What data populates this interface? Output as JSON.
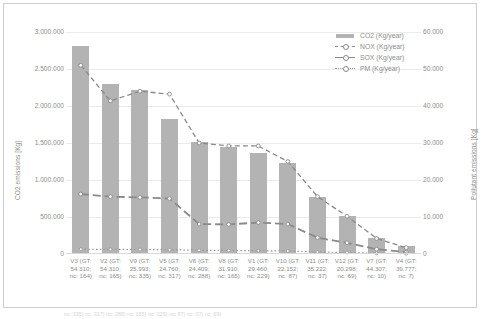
{
  "chart_data": {
    "type": "bar",
    "title": "",
    "xlabel": "",
    "ylabel": "CO2 emissions [Kg]",
    "y2label": "Pollutant emissions [Kg]",
    "grid": true,
    "legend_position": "top-right",
    "ylim": [
      0,
      3000000
    ],
    "y2lim": [
      0,
      60000
    ],
    "yticks": [
      "0",
      "500.000",
      "1.000.000",
      "1.500.000",
      "2.000.000",
      "2.500.000",
      "3.000.000"
    ],
    "ytick_values": [
      0,
      500000,
      1000000,
      1500000,
      2000000,
      2500000,
      3000000
    ],
    "y2ticks": [
      "0",
      "10.000",
      "20.000",
      "30.000",
      "40.000",
      "50.000",
      "60.000"
    ],
    "y2tick_values": [
      0,
      10000,
      20000,
      30000,
      40000,
      50000,
      60000
    ],
    "categories": [
      "V3 (GT: 54.310; nc: 164)",
      "V2 (GT: 54.310; nc: 165)",
      "V9 (GT: 25.993; nc: 335)",
      "V5 (GT: 24.760; nc: 317)",
      "V6 (GT: 24.409; nc: 288)",
      "V8 (GT: 31.910; nc: 165)",
      "V1 (GT: 29.460; nc: 229)",
      "V10 (GT: 22.152; nc: 87)",
      "V11 (GT: 35.222; nc: 37)",
      "V12 (GT: 20.298; nc: 69)",
      "V7 (GT: 44.307; nc: 10)",
      "V4 (GT: 39.777; nc: 7)"
    ],
    "category_parts": [
      [
        "V3 (GT:",
        "54.310;",
        "nc: 164)"
      ],
      [
        "V2 (GT:",
        "54.310;",
        "nc: 165)"
      ],
      [
        "V9 (GT:",
        "25.993;",
        "nc: 335)"
      ],
      [
        "V5 (GT:",
        "24.760;",
        "nc: 317)"
      ],
      [
        "V6 (GT:",
        "24.409;",
        "nc: 288)"
      ],
      [
        "V8 (GT:",
        "31.910;",
        "nc: 165)"
      ],
      [
        "V1 (GT:",
        "29.460;",
        "nc: 229)"
      ],
      [
        "V10 (GT:",
        "22.152;",
        "nc: 87)"
      ],
      [
        "V11 (GT:",
        "35.222;",
        "nc: 37)"
      ],
      [
        "V12 (GT:",
        "20.298;",
        "nc: 69)"
      ],
      [
        "V7 (GT:",
        "44.307;",
        "nc: 10)"
      ],
      [
        "V4 (GT:",
        "39.777;",
        "nc: 7)"
      ]
    ],
    "series": [
      {
        "name": "CO2 (Kg/year)",
        "axis": "left",
        "style": "bar",
        "color": "#b3b3b3",
        "values": [
          2810000,
          2295000,
          2215000,
          1830000,
          1510000,
          1450000,
          1360000,
          1225000,
          770000,
          520000,
          215000,
          105000
        ]
      },
      {
        "name": "NOX (Kg/year)",
        "axis": "right",
        "style": "dashed-line",
        "color": "#8a8a8a",
        "values": [
          51000,
          41400,
          44000,
          43200,
          30000,
          29200,
          29200,
          25000,
          15500,
          10200,
          4200,
          1700
        ]
      },
      {
        "name": "SOX (Kg/year)",
        "axis": "right",
        "style": "long-dash-line",
        "color": "#8a8a8a",
        "values": [
          16200,
          15500,
          15300,
          15000,
          8100,
          8000,
          8500,
          8100,
          4400,
          3000,
          1300,
          500
        ]
      },
      {
        "name": "PM (Kg/year)",
        "axis": "right",
        "style": "dotted-line",
        "color": "#9a9a9a",
        "values": [
          1300,
          1250,
          1200,
          1150,
          1000,
          950,
          900,
          800,
          550,
          400,
          200,
          100
        ]
      }
    ]
  },
  "legend": {
    "items": [
      {
        "label": "CO2 (Kg/year)",
        "key": "bar-swatch"
      },
      {
        "label": "NOX (Kg/year)",
        "key": "dashed-line-marker"
      },
      {
        "label": "SOX (Kg/year)",
        "key": "solid-line-marker"
      },
      {
        "label": "PM (Kg/year)",
        "key": "dotted-line-marker"
      }
    ]
  },
  "axes": {
    "left_title": "CO2 emissions [Kg]",
    "right_title": "Pollutant emissions [Kg]"
  },
  "bottom_cropped_text": "nc: 335)   nc: 317)   nc: 288)   nc: 165)   nc: 229)   nc: 87)   nc: 37)   nc: 69)"
}
